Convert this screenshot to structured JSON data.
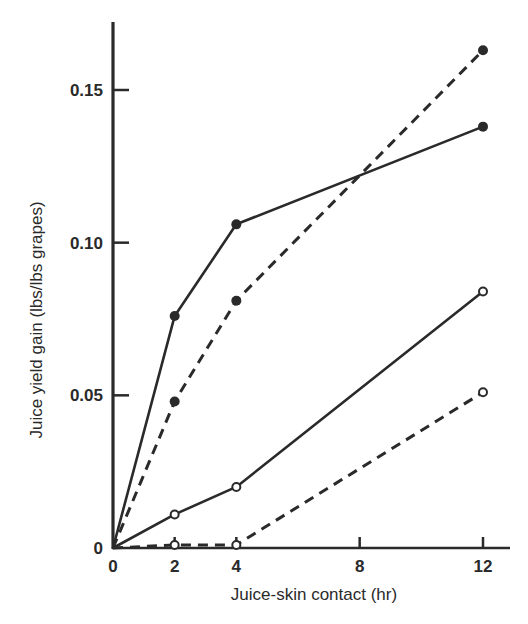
{
  "chart_data": {
    "type": "line",
    "title": "",
    "xlabel": "Juice-skin contact (hr)",
    "ylabel": "Juice yield gain (lbs/lbs grapes)",
    "xlim": [
      0,
      13
    ],
    "ylim": [
      0,
      0.17
    ],
    "grid": false,
    "legend": null,
    "x_ticks": [
      0,
      2,
      4,
      8,
      12
    ],
    "x_tick_labels": [
      "0",
      "2",
      "4",
      "8",
      "12"
    ],
    "y_ticks": [
      0,
      0.05,
      0.1,
      0.15
    ],
    "y_tick_labels": [
      "0",
      "0.05",
      "0.10",
      "0.15"
    ],
    "series": [
      {
        "name": "solid-filled",
        "line_style": "solid",
        "marker": "filled-circle",
        "x": [
          0,
          2,
          4,
          12
        ],
        "values": [
          0,
          0.076,
          0.106,
          0.138
        ]
      },
      {
        "name": "dashed-filled",
        "line_style": "dashed",
        "marker": "filled-circle",
        "x": [
          0,
          2,
          4,
          12
        ],
        "values": [
          0,
          0.048,
          0.081,
          0.163
        ]
      },
      {
        "name": "solid-open",
        "line_style": "solid",
        "marker": "open-circle",
        "x": [
          0,
          2,
          4,
          12
        ],
        "values": [
          0,
          0.011,
          0.02,
          0.084
        ]
      },
      {
        "name": "dashed-open",
        "line_style": "dashed",
        "marker": "open-circle",
        "x": [
          0,
          2,
          4,
          12
        ],
        "values": [
          0,
          0.001,
          0.001,
          0.051
        ]
      }
    ],
    "colors": {
      "ink": "#2a2a2a",
      "background": "#ffffff"
    }
  }
}
